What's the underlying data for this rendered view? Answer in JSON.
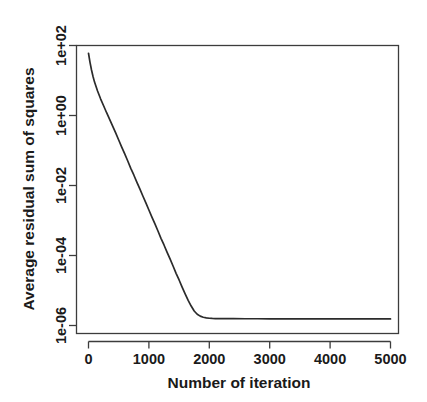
{
  "chart_data": {
    "type": "line",
    "title": "",
    "subtitle": "",
    "xlabel": "Number of iteration",
    "ylabel": "Average residual sum of squares",
    "xlim": [
      0,
      5100
    ],
    "ylim": [
      1e-06,
      100
    ],
    "yscale": "log",
    "xscale": "linear",
    "grid": false,
    "legend": null,
    "legend_position": "none",
    "xticks": [
      0,
      1000,
      2000,
      3000,
      4000,
      5000
    ],
    "xticklabels": [
      "0",
      "1000",
      "2000",
      "3000",
      "4000",
      "5000"
    ],
    "yticks": [
      100,
      1,
      0.01,
      0.0001,
      1e-06
    ],
    "yticklabels": [
      "1e+02",
      "1e+00",
      "1e-02",
      "1e-04",
      "1e-06"
    ],
    "series": [
      {
        "name": "Average residual sum of squares",
        "color": "#2b2b2b",
        "x": [
          0,
          25,
          50,
          75,
          100,
          150,
          200,
          250,
          300,
          350,
          400,
          450,
          500,
          550,
          600,
          650,
          700,
          750,
          800,
          850,
          900,
          950,
          1000,
          1050,
          1100,
          1150,
          1200,
          1250,
          1300,
          1350,
          1400,
          1450,
          1500,
          1550,
          1600,
          1650,
          1700,
          1750,
          1800,
          1850,
          1900,
          1950,
          2000,
          2050,
          2100,
          2200,
          2400,
          2600,
          2800,
          3000,
          3400,
          3800,
          4200,
          4600,
          5000
        ],
        "y": [
          60.0,
          33.0,
          20.0,
          13.0,
          9.0,
          5.0,
          3.0,
          1.9,
          1.2,
          0.78,
          0.5,
          0.32,
          0.2,
          0.125,
          0.08,
          0.05,
          0.031,
          0.02,
          0.0125,
          0.008,
          0.005,
          0.0032,
          0.002,
          0.00125,
          0.0008,
          0.0005,
          0.00031,
          0.0002,
          0.000125,
          8e-05,
          5e-05,
          3.1e-05,
          2e-05,
          1.25e-05,
          8e-06,
          5.2e-06,
          3.6e-06,
          2.6e-06,
          2.1e-06,
          1.85e-06,
          1.72e-06,
          1.65e-06,
          1.61e-06,
          1.59e-06,
          1.58e-06,
          1.57e-06,
          1.565e-06,
          1.56e-06,
          1.56e-06,
          1.555e-06,
          1.55e-06,
          1.55e-06,
          1.55e-06,
          1.548e-06,
          1.545e-06
        ]
      }
    ],
    "annotations": [],
    "colors": {
      "background": "#ffffff",
      "axis": "#3c3c3c",
      "curve": "#2b2b2b",
      "text": "#1a1a1a"
    }
  },
  "axes": {
    "y_tick_labels": [
      "1e+02",
      "1e+00",
      "1e-02",
      "1e-04",
      "1e-06"
    ],
    "x_tick_labels": [
      "0",
      "1000",
      "2000",
      "3000",
      "4000",
      "5000"
    ],
    "x_title": "Number of iteration",
    "y_title": "Average residual sum of squares"
  }
}
